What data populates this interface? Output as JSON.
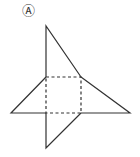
{
  "diagram": {
    "label": "Ⓐ",
    "colors": {
      "stroke": "#333333",
      "background": "#ffffff"
    },
    "square_fold": {
      "x1": 46,
      "y1": 77,
      "x2": 81,
      "y2": 113
    },
    "faces": [
      {
        "name": "top-triangle",
        "points": "46,77 46,26 81,77"
      },
      {
        "name": "left-triangle",
        "points": "46,77 11,113 46,113"
      },
      {
        "name": "right-triangle",
        "points": "81,77 130,113 81,113"
      },
      {
        "name": "bottom-triangle",
        "points": "46,113 46,148 81,113"
      }
    ]
  }
}
